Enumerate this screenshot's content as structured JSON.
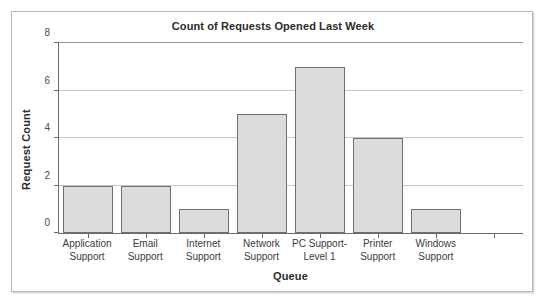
{
  "chart_data": {
    "type": "bar",
    "title": "Count of Requests Opened Last Week",
    "xlabel": "Queue",
    "ylabel": "Request Count",
    "categories": [
      "Application Support",
      "Email Support",
      "Internet Support",
      "Network Support",
      "PC Support-Level 1",
      "Printer Support",
      "Windows Support"
    ],
    "category_lines": [
      [
        "Application",
        "Support"
      ],
      [
        "Email",
        "Support"
      ],
      [
        "Internet",
        "Support"
      ],
      [
        "Network",
        "Support"
      ],
      [
        "PC Support-",
        "Level 1"
      ],
      [
        "Printer",
        "Support"
      ],
      [
        "Windows",
        "Support"
      ]
    ],
    "values": [
      2,
      2,
      1,
      5,
      7,
      4,
      1
    ],
    "ylim": [
      0,
      8
    ],
    "yticks": [
      0,
      2,
      4,
      6,
      8
    ],
    "ytick_labels": [
      "0",
      "2",
      "4",
      "6",
      "8"
    ],
    "grid": true,
    "grid_axis": "y",
    "legend": false,
    "bar_fill_color": "#dcdcdc",
    "bar_border_color": "#6f6f6f",
    "axis_color": "#6a6a6a",
    "gridline_color": "#c6c6c6",
    "plot_background": "#ffffff",
    "figure_border_color": "#b9b9b9",
    "n_slots": 8
  }
}
